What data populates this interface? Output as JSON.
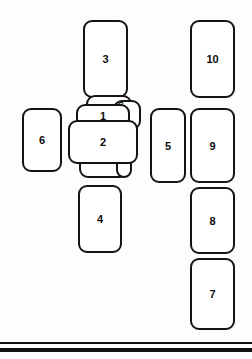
{
  "diagram": {
    "background_color": "#fdfdfd",
    "stroke_color": "#141414",
    "fill_color": "#ffffff",
    "boxes": [
      {
        "id": "box-3",
        "label": "3",
        "x": 83,
        "y": 20,
        "w": 45,
        "h": 78
      },
      {
        "id": "box-10",
        "label": "10",
        "x": 190,
        "y": 20,
        "w": 45,
        "h": 78
      },
      {
        "id": "box-6",
        "label": "6",
        "x": 22,
        "y": 108,
        "w": 40,
        "h": 64
      },
      {
        "id": "box-5",
        "label": "5",
        "x": 150,
        "y": 108,
        "w": 36,
        "h": 75
      },
      {
        "id": "box-9",
        "label": "9",
        "x": 190,
        "y": 108,
        "w": 45,
        "h": 75
      },
      {
        "id": "box-8",
        "label": "8",
        "x": 190,
        "y": 187,
        "w": 45,
        "h": 67
      },
      {
        "id": "box-4",
        "label": "4",
        "x": 78,
        "y": 185,
        "w": 44,
        "h": 68
      },
      {
        "id": "box-7",
        "label": "7",
        "x": 190,
        "y": 258,
        "w": 45,
        "h": 72
      }
    ],
    "cluster": {
      "name": "central-overlapping-cluster",
      "behind_shapes": [
        {
          "id": "cluster-back-top",
          "x": 86,
          "y": 95,
          "w": 46,
          "h": 22
        },
        {
          "id": "cluster-back-right",
          "x": 113,
          "y": 100,
          "w": 28,
          "h": 30
        },
        {
          "id": "cluster-back-bottom",
          "x": 79,
          "y": 152,
          "w": 50,
          "h": 26
        },
        {
          "id": "cluster-back-lower",
          "x": 116,
          "y": 150,
          "w": 16,
          "h": 28
        }
      ],
      "box_1": {
        "id": "box-1",
        "label": "1",
        "x": 76,
        "y": 104,
        "w": 54,
        "h": 24
      },
      "box_2": {
        "id": "box-2",
        "label": "2",
        "x": 68,
        "y": 120,
        "w": 70,
        "h": 44
      },
      "small_label": {
        "id": "label-5-occluded",
        "text": "S",
        "x": 118,
        "y": 101
      }
    },
    "rules": [
      {
        "id": "rule-upper",
        "y": 342,
        "thickness": 2
      },
      {
        "id": "rule-lower",
        "y": 348,
        "thickness": 4
      }
    ]
  }
}
